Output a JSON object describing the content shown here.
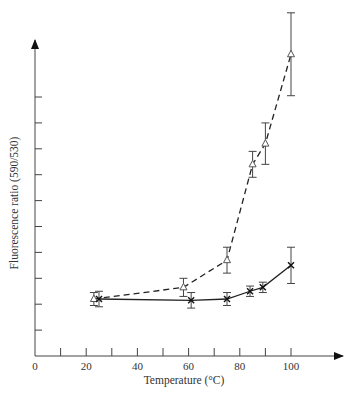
{
  "chart_data": {
    "type": "line",
    "title": "",
    "xlabel": "Temperature (°C)",
    "ylabel": "Fluorescence ratio (590/530)",
    "xlim": [
      0,
      120
    ],
    "ylim": [
      0,
      12
    ],
    "x_ticks": [
      0,
      20,
      40,
      60,
      80,
      100
    ],
    "x_minor_ticks": [
      10,
      30,
      50,
      70,
      90
    ],
    "y_ticks_unlabeled": [
      1,
      2,
      3,
      4,
      5,
      6,
      7,
      8,
      9,
      10
    ],
    "y_units_note": "y-axis has tick marks but no numeric labels; values in tick units",
    "grid": false,
    "legend": null,
    "series": [
      {
        "name": "triangle (dashed)",
        "marker": "triangle-open",
        "line_style": "dashed",
        "x": [
          23,
          58,
          75,
          85,
          90,
          100
        ],
        "y": [
          2.2,
          2.65,
          3.7,
          7.4,
          8.2,
          11.65
        ],
        "yerr": [
          0.25,
          0.35,
          0.5,
          0.5,
          0.8,
          1.6
        ]
      },
      {
        "name": "cross (solid)",
        "marker": "x",
        "line_style": "solid",
        "x": [
          25,
          61,
          75,
          84,
          89,
          100
        ],
        "y": [
          2.2,
          2.15,
          2.2,
          2.5,
          2.65,
          3.5
        ],
        "yerr": [
          0.3,
          0.3,
          0.25,
          0.2,
          0.2,
          0.7
        ]
      }
    ]
  },
  "labels": {
    "x_axis_title": "Temperature (°C)",
    "y_axis_title": "Fluorescence ratio (590/530)",
    "x_tick_labels": [
      "0",
      "20",
      "40",
      "60",
      "80",
      "100"
    ]
  }
}
